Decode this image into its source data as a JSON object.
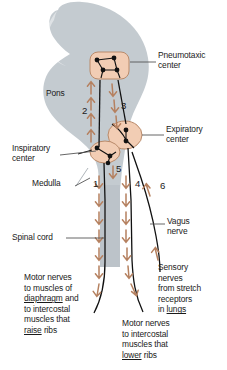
{
  "figure": {
    "colors": {
      "silhouette": "#c4cbd0",
      "nucleus_fill": "#f2cdb4",
      "nucleus_stroke": "#b98a6a",
      "arrow": "#b5805f",
      "nerve_line": "#111111",
      "text": "#1a1a1a",
      "leader_line": "#555555",
      "background": "#ffffff"
    }
  },
  "region_labels": {
    "pons": "Pons",
    "medulla": "Medulla",
    "spinal_cord": "Spinal cord"
  },
  "center_labels": {
    "pneumotaxic": "Pneumotaxic\ncenter",
    "expiratory": "Expiratory\ncenter",
    "inspiratory": "Inspiratory\ncenter"
  },
  "nerve_labels": {
    "vagus": "Vagus\nnerve"
  },
  "pathway_numbers": [
    "1",
    "2",
    "3",
    "4",
    "5",
    "6"
  ],
  "text_blocks": {
    "motor_diaphragm": {
      "lines": [
        {
          "text": "Motor nerves"
        },
        {
          "text": "to muscles of"
        },
        {
          "pre": "",
          "underline": "diaphragm",
          "post": " and"
        },
        {
          "text": "to intercostal"
        },
        {
          "text": "muscles that"
        },
        {
          "pre": "",
          "underline": "raise",
          "post": " ribs"
        }
      ]
    },
    "sensory_stretch": {
      "lines": [
        {
          "text": "Sensory"
        },
        {
          "text": "nerves"
        },
        {
          "text": "from stretch"
        },
        {
          "text": "receptors"
        },
        {
          "pre": "in ",
          "underline": "lungs",
          "post": ""
        }
      ]
    },
    "motor_lower_ribs": {
      "lines": [
        {
          "text": "Motor nerves"
        },
        {
          "text": "to intercostal"
        },
        {
          "text": "muscles that"
        },
        {
          "pre": "",
          "underline": "lower",
          "post": " ribs"
        }
      ]
    }
  }
}
